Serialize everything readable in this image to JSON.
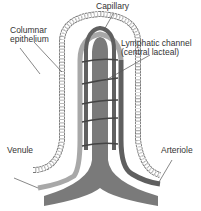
{
  "labels": {
    "capillary": "Capillary",
    "columnar_1": "Columnar",
    "columnar_2": "epithelium",
    "lymph_1": "Lymphatic channel",
    "lymph_2": "(central lacteal)",
    "venule": "Venule",
    "arteriole": "Arteriole"
  },
  "colors": {
    "lacteal": "#7a7a7a",
    "capillary_dark": "#5f5f5f",
    "capillary_light": "#a8a8a8",
    "epithelium": "#777777",
    "leader": "#555555"
  }
}
